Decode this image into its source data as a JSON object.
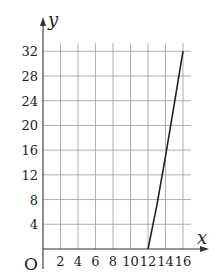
{
  "chart_data": {
    "type": "line",
    "title": "",
    "xlabel": "x",
    "ylabel": "y",
    "origin_label": "O",
    "xlim": [
      0,
      17
    ],
    "ylim": [
      0,
      35
    ],
    "grid": true,
    "x_ticks": [
      2,
      4,
      6,
      8,
      10,
      12,
      14,
      16
    ],
    "y_ticks": [
      4,
      8,
      12,
      16,
      20,
      24,
      28,
      32
    ],
    "series": [
      {
        "name": "curve",
        "x": [
          12,
          13,
          14,
          15,
          16
        ],
        "y": [
          0,
          7,
          15,
          23.5,
          32
        ],
        "color": "#222222"
      }
    ],
    "legend": null
  }
}
